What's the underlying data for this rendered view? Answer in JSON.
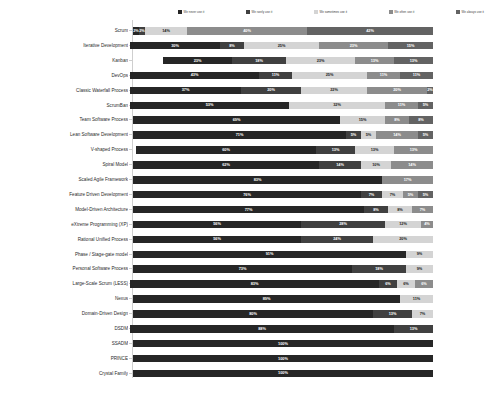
{
  "chart_data": {
    "type": "bar",
    "title": "",
    "subtitle": "",
    "xlabel": "",
    "ylabel": "",
    "orientation": "horizontal",
    "stacked": true,
    "normalized_percent": true,
    "xlim": [
      0,
      100
    ],
    "grid": false,
    "legend_position": "top",
    "value_suffix": "%",
    "series": [
      {
        "name": "We never use it",
        "color": "#262626"
      },
      {
        "name": "We rarely use it",
        "color": "#404040"
      },
      {
        "name": "We sometimes use it",
        "color": "#d4d4d4"
      },
      {
        "name": "We often use it",
        "color": "#8c8c8c"
      },
      {
        "name": "We always use it",
        "color": "#636363"
      }
    ],
    "categories": [
      "Scrum",
      "Iterative Development",
      "Kanban",
      "DevOps",
      "Classic Waterfall Process",
      "ScrumBan",
      "Team Software Process",
      "Lean Software Development",
      "V-shaped Process",
      "Spiral Model",
      "Scaled Agile Framework",
      "Feature Driven Development",
      "Model-Driven Architecture",
      "eXtreme Programming (XP)",
      "Rational Unified Process",
      "Phase / Stage-gate model",
      "Personal Software Process",
      "Large-Scale Scrum (LESS)",
      "Nexus",
      "Domain-Driven Design",
      "DSDM",
      "SSADM",
      "PRINCE",
      "Crystal Family"
    ],
    "rows": [
      {
        "category": "Scrum",
        "values": [
          2,
          2,
          14,
          40,
          42
        ],
        "labels": [
          "2%",
          "2%",
          "14%",
          "40%",
          "42%"
        ]
      },
      {
        "category": "Iterative Development",
        "values": [
          30,
          8,
          25,
          23,
          15
        ],
        "labels": [
          "30%",
          "8%",
          "25%",
          "23%",
          "15%"
        ]
      },
      {
        "category": "Kanban",
        "values": [
          23,
          18,
          23,
          13,
          13
        ],
        "labels": [
          "23%",
          "18%",
          "23%",
          "13%",
          "13%"
        ]
      },
      {
        "category": "DevOps",
        "values": [
          43,
          11,
          25,
          11,
          11
        ],
        "labels": [
          "43%",
          "11%",
          "25%",
          "11%",
          "11%"
        ]
      },
      {
        "category": "Classic Waterfall Process",
        "values": [
          37,
          20,
          22,
          20,
          2
        ],
        "labels": [
          "37%",
          "20%",
          "22%",
          "20%",
          "2%"
        ]
      },
      {
        "category": "ScrumBan",
        "values": [
          53,
          0,
          32,
          11,
          5
        ],
        "labels": [
          "53%",
          "",
          "32%",
          "11%",
          "5%"
        ]
      },
      {
        "category": "Team Software Process",
        "values": [
          69,
          0,
          15,
          8,
          8
        ],
        "labels": [
          "69%",
          "",
          "15%",
          "8%",
          "8%"
        ]
      },
      {
        "category": "Lean Software Development",
        "values": [
          71,
          5,
          5,
          14,
          5
        ],
        "labels": [
          "71%",
          "5%",
          "5%",
          "14%",
          "5%"
        ]
      },
      {
        "category": "V-shaped Process",
        "values": [
          60,
          13,
          13,
          13,
          0
        ],
        "labels": [
          "60%",
          "13%",
          "13%",
          "13%",
          ""
        ]
      },
      {
        "category": "Spiral Model",
        "values": [
          62,
          14,
          10,
          14,
          0
        ],
        "labels": [
          "62%",
          "14%",
          "10%",
          "14%",
          ""
        ]
      },
      {
        "category": "Scaled Agile Framework",
        "values": [
          83,
          0,
          0,
          17,
          0
        ],
        "labels": [
          "83%",
          "",
          "",
          "17%",
          ""
        ]
      },
      {
        "category": "Feature Driven Development",
        "values": [
          76,
          7,
          7,
          5,
          5
        ],
        "labels": [
          "76%",
          "7%",
          "7%",
          "5%",
          "5%"
        ]
      },
      {
        "category": "Model-Driven Architecture",
        "values": [
          77,
          8,
          8,
          7,
          0
        ],
        "labels": [
          "77%",
          "8%",
          "8%",
          "7%",
          ""
        ]
      },
      {
        "category": "eXtreme Programming (XP)",
        "values": [
          56,
          28,
          12,
          4,
          0
        ],
        "labels": [
          "56%",
          "28%",
          "12%",
          "4%",
          ""
        ]
      },
      {
        "category": "Rational Unified Process",
        "values": [
          56,
          24,
          20,
          0,
          0
        ],
        "labels": [
          "56%",
          "24%",
          "20%",
          "",
          ""
        ]
      },
      {
        "category": "Phase / Stage-gate model",
        "values": [
          91,
          0,
          9,
          0,
          0
        ],
        "labels": [
          "91%",
          "",
          "9%",
          "",
          ""
        ]
      },
      {
        "category": "Personal Software Process",
        "values": [
          73,
          18,
          9,
          0,
          0
        ],
        "labels": [
          "73%",
          "18%",
          "9%",
          "",
          ""
        ]
      },
      {
        "category": "Large-Scale Scrum (LESS)",
        "values": [
          83,
          6,
          6,
          6,
          0
        ],
        "labels": [
          "83%",
          "6%",
          "6%",
          "6%",
          ""
        ]
      },
      {
        "category": "Nexus",
        "values": [
          89,
          0,
          11,
          0,
          0
        ],
        "labels": [
          "89%",
          "",
          "11%",
          "",
          ""
        ]
      },
      {
        "category": "Domain-Driven Design",
        "values": [
          80,
          13,
          7,
          0,
          0
        ],
        "labels": [
          "80%",
          "13%",
          "7%",
          "",
          ""
        ]
      },
      {
        "category": "DSDM",
        "values": [
          88,
          13,
          0,
          0,
          0
        ],
        "labels": [
          "88%",
          "13%",
          "",
          "",
          ""
        ]
      },
      {
        "category": "SSADM",
        "values": [
          100,
          0,
          0,
          0,
          0
        ],
        "labels": [
          "100%",
          "",
          "",
          "",
          ""
        ]
      },
      {
        "category": "PRINCE",
        "values": [
          100,
          0,
          0,
          0,
          0
        ],
        "labels": [
          "100%",
          "",
          "",
          "",
          ""
        ]
      },
      {
        "category": "Crystal Family",
        "values": [
          100,
          0,
          0,
          0,
          0
        ],
        "labels": [
          "100%",
          "",
          "",
          "",
          ""
        ]
      }
    ]
  },
  "layout": {
    "plot_left_px": 133,
    "plot_width_px": 300,
    "row_pitch_px": 14.9,
    "bar_height_px": 7.5
  }
}
